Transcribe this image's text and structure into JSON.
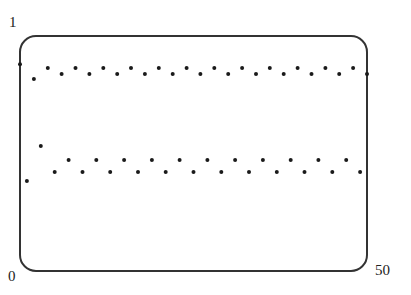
{
  "chart_data": {
    "type": "scatter",
    "title": "",
    "xlabel": "",
    "ylabel": "",
    "xlim": [
      0,
      50
    ],
    "ylim": [
      0,
      1
    ],
    "grid": false,
    "legend": null,
    "tick_labels": {
      "y_top": "1",
      "origin": "0",
      "x_right": "50"
    },
    "x": [
      0,
      1,
      2,
      3,
      4,
      5,
      6,
      7,
      8,
      9,
      10,
      11,
      12,
      13,
      14,
      15,
      16,
      17,
      18,
      19,
      20,
      21,
      22,
      23,
      24,
      25,
      26,
      27,
      28,
      29,
      30,
      31,
      32,
      33,
      34,
      35,
      36,
      37,
      38,
      39,
      40,
      41,
      42,
      43,
      44,
      45,
      46,
      47,
      48,
      49,
      50
    ],
    "series": [
      {
        "name": "iterates",
        "values": [
          0.88,
          0.383,
          0.817,
          0.532,
          0.864,
          0.421,
          0.838,
          0.472,
          0.864,
          0.421,
          0.838,
          0.472,
          0.864,
          0.421,
          0.838,
          0.472,
          0.864,
          0.421,
          0.838,
          0.472,
          0.864,
          0.421,
          0.838,
          0.472,
          0.864,
          0.421,
          0.838,
          0.472,
          0.864,
          0.421,
          0.838,
          0.472,
          0.864,
          0.421,
          0.838,
          0.472,
          0.864,
          0.421,
          0.838,
          0.472,
          0.864,
          0.421,
          0.838,
          0.472,
          0.864,
          0.421,
          0.838,
          0.472,
          0.864,
          0.421,
          0.838
        ]
      }
    ],
    "colors": {
      "frame": "#333333",
      "points": "#1a1a1a",
      "background": "#ffffff"
    }
  }
}
